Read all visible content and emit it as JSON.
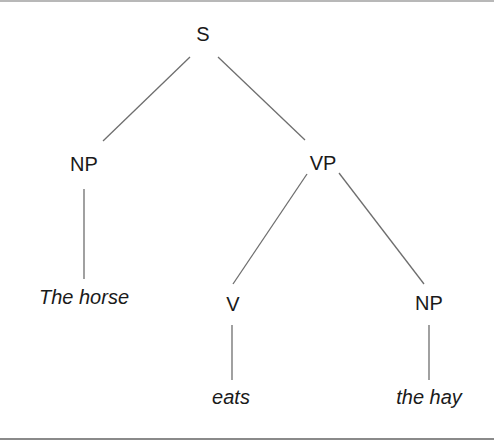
{
  "diagram": {
    "type": "syntax-tree",
    "nodes": {
      "s": {
        "label": "S"
      },
      "np_subject": {
        "label": "NP"
      },
      "vp": {
        "label": "VP"
      },
      "v": {
        "label": "V"
      },
      "np_object": {
        "label": "NP"
      }
    },
    "leaves": {
      "subject": {
        "label": "The horse"
      },
      "verb": {
        "label": "eats"
      },
      "object": {
        "label": "the hay"
      }
    },
    "edges": [
      {
        "from": "S",
        "to": "NP"
      },
      {
        "from": "S",
        "to": "VP"
      },
      {
        "from": "NP",
        "to": "The horse"
      },
      {
        "from": "VP",
        "to": "V"
      },
      {
        "from": "VP",
        "to": "NP"
      },
      {
        "from": "V",
        "to": "eats"
      },
      {
        "from": "NP",
        "to": "the hay"
      }
    ],
    "colors": {
      "text": "#1a1a1a",
      "edge": "#6e6e6e",
      "background": "#ffffff"
    }
  }
}
